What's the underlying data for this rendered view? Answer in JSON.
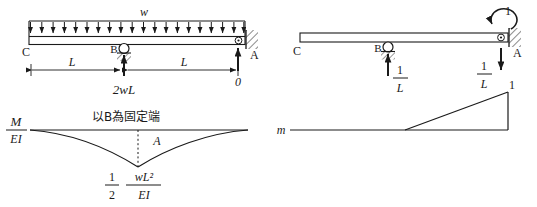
{
  "figure": {
    "ink_color": "#1a1a1a",
    "background_color": "#ffffff"
  },
  "panels": {
    "top_left": {
      "name": "real-load-beam",
      "distributed_load_label": "w",
      "distributed_load_arrow_count": 20,
      "node_left_label": "C",
      "node_mid_label": "B",
      "node_right_label": "A",
      "support_mid_type": "roller-on-hatched-base",
      "support_right_type": "fixed-wall-hatched",
      "reaction_mid_label": "2wL",
      "reaction_right_label": "0",
      "dimension_left_label": "L",
      "dimension_right_label": "L"
    },
    "bottom_left": {
      "name": "m-over-ei-diagram",
      "axis_label_numerator": "M",
      "axis_label_denominator": "EI",
      "note": "以B為固定端",
      "area_label": "A",
      "peak_fraction_left_numerator": "1",
      "peak_fraction_left_denominator": "2",
      "peak_fraction_right_numerator": "wL²",
      "peak_fraction_right_denominator": "EI",
      "curve_shape": "two-parabolas-meeting-at-center-vertex",
      "sign": "negative"
    },
    "top_right": {
      "name": "virtual-unit-moment-beam",
      "applied_moment_label": "1",
      "applied_moment_direction": "counterclockwise",
      "node_left_label": "C",
      "node_mid_label": "B",
      "node_right_label": "A",
      "support_mid_type": "roller-on-hatched-base",
      "support_right_type": "fixed-wall-hatched",
      "reaction_mid_numerator": "1",
      "reaction_mid_denominator": "L",
      "reaction_mid_direction": "up",
      "reaction_right_numerator": "1",
      "reaction_right_denominator": "L",
      "reaction_right_direction": "down"
    },
    "bottom_right": {
      "name": "virtual-m-diagram",
      "axis_label": "m",
      "peak_label": "1",
      "shape": "triangle-rising-to-right",
      "zero_start_fraction_of_span": 0.5
    }
  }
}
